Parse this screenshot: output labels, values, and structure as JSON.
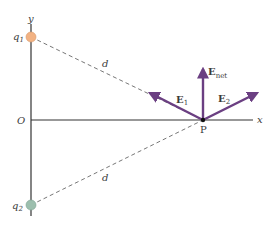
{
  "diagram": {
    "axes": {
      "x_label": "x",
      "y_label": "y",
      "origin_label": "O"
    },
    "charges": [
      {
        "name": "q",
        "sub": "1",
        "color": "#f2b283"
      },
      {
        "name": "q",
        "sub": "2",
        "color": "#9cbfae"
      }
    ],
    "distances": [
      {
        "label": "d"
      },
      {
        "label": "d"
      }
    ],
    "point": {
      "label": "P"
    },
    "vectors": [
      {
        "name": "E",
        "sub": "1"
      },
      {
        "name": "E",
        "sub": "2"
      },
      {
        "name": "E",
        "sub": "net"
      }
    ],
    "colors": {
      "vector": "#6b3f82",
      "axis": "#333333",
      "dashed": "#777777"
    }
  }
}
